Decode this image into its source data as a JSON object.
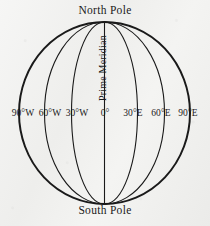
{
  "figure": {
    "title_alt": "Globe showing meridians of longitude",
    "background_color": "#f2f2f0",
    "ink_color": "#1a1a1a"
  },
  "labels": {
    "north_pole": "North Pole",
    "south_pole": "South Pole",
    "prime_meridian": "Prime Meridian"
  },
  "meridians": [
    {
      "label": "90°W",
      "longitude": -90,
      "x": 19,
      "rx": 85.5,
      "outline": true
    },
    {
      "label": "60°W",
      "longitude": -60,
      "x": 45,
      "rx": 60.0,
      "outline": false
    },
    {
      "label": "30°W",
      "longitude": -30,
      "x": 72,
      "rx": 33.0,
      "outline": false
    },
    {
      "label": "0°",
      "longitude": 0,
      "x": 104.5,
      "rx": 0.0,
      "outline": false
    },
    {
      "label": "30°E",
      "longitude": 30,
      "x": 137,
      "rx": 33.0,
      "outline": false
    },
    {
      "label": "60°E",
      "longitude": 60,
      "x": 164,
      "rx": 60.0,
      "outline": false
    },
    {
      "label": "90°E",
      "longitude": 90,
      "x": 190,
      "rx": 85.5,
      "outline": true
    }
  ],
  "geometry": {
    "center_x": 104.5,
    "center_y": 113,
    "radius_x": 85.5,
    "radius_y": 91
  }
}
